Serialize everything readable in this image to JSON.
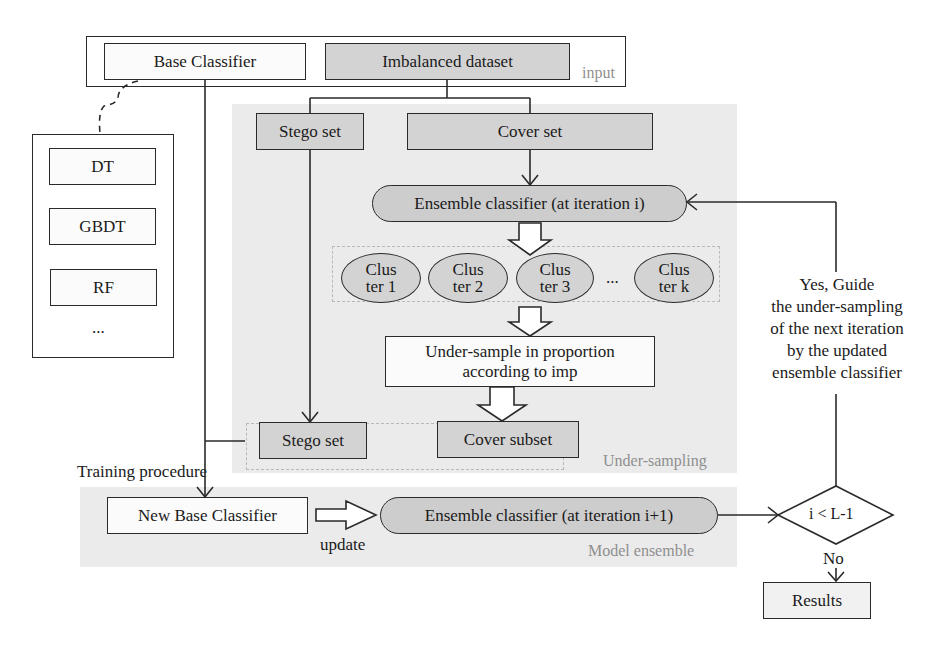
{
  "input": {
    "region_label": "input",
    "base_classifier": "Base Classifier",
    "imbalanced_dataset": "Imbalanced dataset"
  },
  "base_classifier_options": {
    "items": [
      "DT",
      "GBDT",
      "RF",
      "..."
    ]
  },
  "under_sampling": {
    "region_label": "Under-sampling",
    "stego_set": "Stego set",
    "cover_set": "Cover set",
    "ensemble_classifier": "Ensemble classifier (at iteration i)",
    "clusters": [
      {
        "line1": "Clus",
        "line2": "ter 1"
      },
      {
        "line1": "Clus",
        "line2": "ter 2"
      },
      {
        "line1": "Clus",
        "line2": "ter 3"
      },
      {
        "line1": "Clus",
        "line2": "ter k"
      }
    ],
    "cluster_ellipsis": "...",
    "under_sample_line1": "Under-sample in proportion",
    "under_sample_line2": "according to imp",
    "stego_set_out": "Stego set",
    "cover_subset": "Cover subset"
  },
  "training_procedure_label": "Training procedure",
  "model_ensemble": {
    "region_label": "Model ensemble",
    "new_base_classifier": "New Base Classifier",
    "update_label": "update",
    "ensemble_classifier_next": "Ensemble classifier (at iteration i+1)"
  },
  "decision": {
    "condition": "i < L-1",
    "yes_label_lines": [
      "Yes, Guide",
      "the under-sampling",
      "of the next iteration",
      "by the updated",
      "ensemble classifier"
    ],
    "no_label": "No",
    "results": "Results"
  },
  "colors": {
    "region_bg": "#ebebeb",
    "gray_box": "#d3d3d3",
    "pill_box": "#cdcdcd",
    "line": "#2a2a2a",
    "region_label": "#8f8f8f"
  }
}
